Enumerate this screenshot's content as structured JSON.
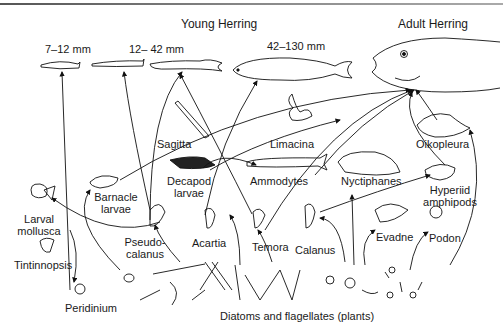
{
  "headings": {
    "young_herring": "Young Herring",
    "adult_herring": "Adult Herring"
  },
  "sizes": {
    "s1": "7–12 mm",
    "s2": "12– 42 mm",
    "s3": "42–130 mm"
  },
  "organisms": {
    "sagitta": "Sagitta",
    "limacina": "Limacina",
    "oikopleura": "Oikopleura",
    "decapod_1": "Decapod",
    "decapod_2": "larvae",
    "ammodytes": "Ammodytes",
    "nyctiphanes": "Nyctiphanes",
    "hyperiid_1": "Hyperiid",
    "hyperiid_2": "amphipods",
    "barnacle_1": "Barnacle",
    "barnacle_2": "larvae",
    "larval_1": "Larval",
    "larval_2": "mollusca",
    "pseudo_1": "Pseudo-",
    "pseudo_2": "calanus",
    "acartia": "Acartia",
    "temora": "Temora",
    "calanus": "Calanus",
    "evadne": "Evadne",
    "podon": "Podon",
    "tintinnopsis": "Tintinnopsis",
    "peridinium": "Peridinium"
  },
  "base": {
    "plants": "Diatoms and flagellates (plants)"
  },
  "colors": {
    "line": "#111111",
    "text": "#1a1a1a",
    "background": "#ffffff"
  }
}
